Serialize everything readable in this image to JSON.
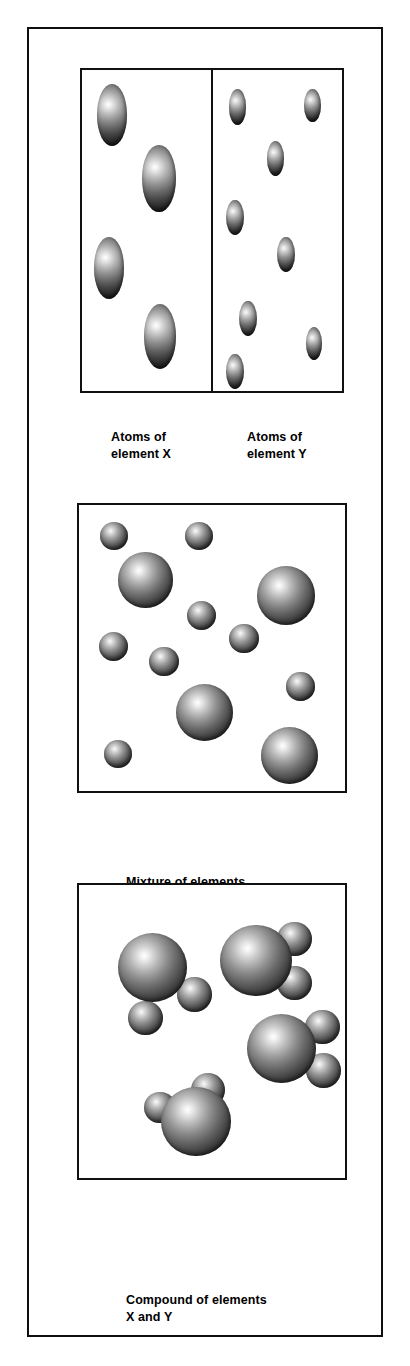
{
  "figure": {
    "frame_color": "#0f0f0f",
    "background_color": "#ffffff",
    "panel_border_color": "#111111"
  },
  "panels": [
    {
      "id": "elements",
      "kind": "split",
      "halves": [
        {
          "id": "element-x",
          "caption": "Atoms of\nelement X",
          "atom_label": "X",
          "atom_kind": "large",
          "atom_count": 4,
          "atoms": [
            {
              "cx": 23,
              "cy": 19,
              "r": 15.5
            },
            {
              "cx": 67,
              "cy": 42,
              "r": 16.5
            },
            {
              "cx": 26,
              "cy": 68,
              "r": 15.5
            },
            {
              "cx": 70,
              "cy": 91,
              "r": 16.0
            }
          ]
        },
        {
          "id": "element-y",
          "caption": "Atoms of\nelement Y",
          "atom_label": "Y",
          "atom_kind": "small",
          "atom_count": 7,
          "atoms": [
            {
              "cx": 16,
              "cy": 10,
              "r": 8.0
            },
            {
              "cx": 83,
              "cy": 10,
              "r": 7.5
            },
            {
              "cx": 50,
              "cy": 26,
              "r": 8.0
            },
            {
              "cx": 15,
              "cy": 45,
              "r": 8.0
            },
            {
              "cx": 58,
              "cy": 57,
              "r": 8.0
            },
            {
              "cx": 27,
              "cy": 77,
              "r": 8.0
            },
            {
              "cx": 85,
              "cy": 85,
              "r": 7.5
            },
            {
              "cx": 16,
              "cy": 93,
              "r": 8.0
            }
          ]
        }
      ]
    },
    {
      "id": "mixture",
      "kind": "single",
      "caption": "Mixture of elements\nX and Y",
      "atoms": [
        {
          "cx": 13,
          "cy": 10,
          "r": 5.5,
          "kind": "small"
        },
        {
          "cx": 45,
          "cy": 10,
          "r": 5.5,
          "kind": "small"
        },
        {
          "cx": 25,
          "cy": 26,
          "r": 10.8,
          "kind": "large"
        },
        {
          "cx": 78,
          "cy": 31,
          "r": 11.2,
          "kind": "large"
        },
        {
          "cx": 46,
          "cy": 37,
          "r": 5.8,
          "kind": "small"
        },
        {
          "cx": 62,
          "cy": 45,
          "r": 5.8,
          "kind": "small"
        },
        {
          "cx": 13,
          "cy": 48,
          "r": 5.8,
          "kind": "small"
        },
        {
          "cx": 32,
          "cy": 53,
          "r": 5.8,
          "kind": "small"
        },
        {
          "cx": 83,
          "cy": 62,
          "r": 5.6,
          "kind": "small"
        },
        {
          "cx": 47,
          "cy": 73,
          "r": 11.0,
          "kind": "large"
        },
        {
          "cx": 15,
          "cy": 86,
          "r": 5.6,
          "kind": "small"
        },
        {
          "cx": 79,
          "cy": 88,
          "r": 11.0,
          "kind": "large"
        }
      ],
      "large_count": 4,
      "small_count": 8
    },
    {
      "id": "compound",
      "kind": "single",
      "caption": "Compound of elements\nX and Y",
      "molecule_formula": "XY2",
      "molecules": [
        {
          "id": "molecule-1",
          "center": {
            "cx": 28,
            "cy": 29
          },
          "core": {
            "r": 13.5
          },
          "satellites": [
            {
              "dx": 15.5,
              "dy": 8.5,
              "r": 7.0
            },
            {
              "dx": -3.0,
              "dy": 16.0,
              "r": 7.0
            }
          ]
        },
        {
          "id": "molecule-2",
          "center": {
            "cx": 66,
            "cy": 26
          },
          "core": {
            "r": 14.0
          },
          "satellites": [
            {
              "dx": 15.0,
              "dy": -7.5,
              "r": 7.0
            },
            {
              "dx": 15.5,
              "dy": 9.0,
              "r": 7.0
            }
          ]
        },
        {
          "id": "molecule-3",
          "center": {
            "cx": 76,
            "cy": 56
          },
          "core": {
            "r": 13.5
          },
          "satellites": [
            {
              "dx": 15.0,
              "dy": -8.5,
              "r": 7.0
            },
            {
              "dx": 16.0,
              "dy": 7.5,
              "r": 7.0
            }
          ]
        },
        {
          "id": "molecule-4",
          "center": {
            "cx": 44,
            "cy": 81
          },
          "core": {
            "r": 13.5
          },
          "satellites": [
            {
              "dx": 2.0,
              "dy": -16.0,
              "r": 7.0
            },
            {
              "dx": -15.5,
              "dy": -5.5,
              "r": 6.5
            }
          ]
        }
      ]
    }
  ]
}
